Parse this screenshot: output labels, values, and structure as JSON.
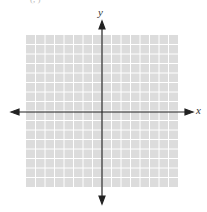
{
  "header": {
    "cut_text": "(, )"
  },
  "graph": {
    "x_axis_label": "x",
    "y_axis_label": "y",
    "grid_columns": 16,
    "grid_rows": 16,
    "grid_fill": "#dcdcdc",
    "grid_line": "#ffffff",
    "axis_color": "#222222"
  },
  "chart_data": {
    "type": "grid",
    "title": "",
    "xlabel": "x",
    "ylabel": "y",
    "grid": true,
    "series": []
  }
}
